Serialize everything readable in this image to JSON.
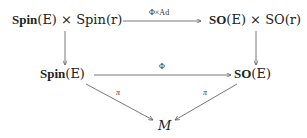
{
  "nodes": {
    "top_left": {
      "bold": "Spin",
      "arg1": "(E)",
      "times": " × ",
      "plain": "Spin",
      "arg2": "(r)"
    },
    "top_right": {
      "bold": "SO",
      "arg1": "(E)",
      "times": " × ",
      "plain": "SO",
      "arg2": "(r)"
    },
    "mid_left": {
      "bold": "Spin",
      "arg": "(E)"
    },
    "mid_right": {
      "bold": "SO",
      "arg": "(E)"
    },
    "bottom": {
      "label": "M"
    }
  },
  "arrows": {
    "top": {
      "label": "Φ×Ad"
    },
    "middle": {
      "label": "Φ"
    },
    "left_diag": {
      "label": "π"
    },
    "right_diag": {
      "label": "π"
    }
  },
  "colors": {
    "arrow": "#555555",
    "text": "#222222"
  }
}
